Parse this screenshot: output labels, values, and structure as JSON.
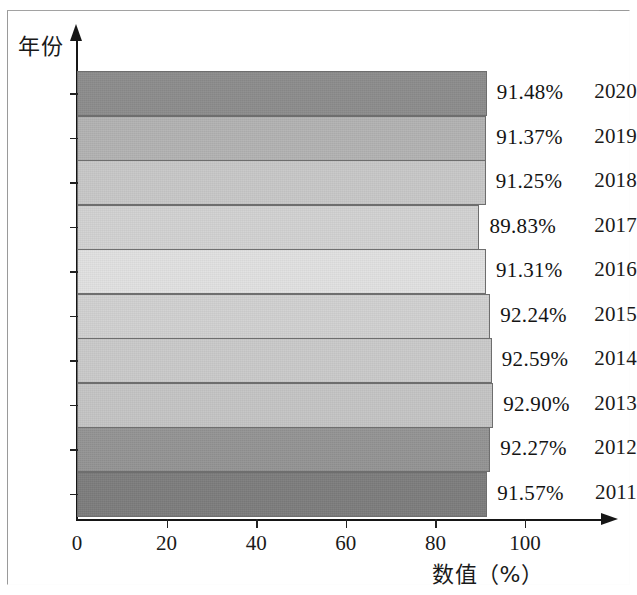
{
  "axes": {
    "y_title": "年份",
    "x_title": "数值（%）",
    "x_ticks": [
      "0",
      "20",
      "40",
      "60",
      "80",
      "100"
    ]
  },
  "chart_data": {
    "type": "bar",
    "orientation": "horizontal",
    "title": "",
    "xlabel": "数值（%）",
    "ylabel": "年份",
    "xlim": [
      0,
      112
    ],
    "grid": false,
    "legend": null,
    "categories": [
      "2020",
      "2019",
      "2018",
      "2017",
      "2016",
      "2015",
      "2014",
      "2013",
      "2012",
      "2011"
    ],
    "values": [
      91.48,
      91.37,
      91.25,
      89.83,
      91.31,
      92.24,
      92.59,
      92.9,
      92.27,
      91.57
    ],
    "value_labels": [
      "91.48%",
      "91.37%",
      "91.25%",
      "89.83%",
      "91.31%",
      "92.24%",
      "92.59%",
      "92.90%",
      "92.27%",
      "91.57%"
    ],
    "bar_colors": [
      "#8d8d8d",
      "#b4b4b4",
      "#c9c9c9",
      "#d3d3d3",
      "#e2e2e2",
      "#d2d2d2",
      "#cbcbcb",
      "#c6c6c6",
      "#959595",
      "#7e7e7e"
    ],
    "bars": [
      {
        "year": "2020",
        "value": 91.48,
        "label": "91.48%",
        "color": "#8d8d8d"
      },
      {
        "year": "2019",
        "value": 91.37,
        "label": "91.37%",
        "color": "#b4b4b4"
      },
      {
        "year": "2018",
        "value": 91.25,
        "label": "91.25%",
        "color": "#c9c9c9"
      },
      {
        "year": "2017",
        "value": 89.83,
        "label": "89.83%",
        "color": "#d3d3d3"
      },
      {
        "year": "2016",
        "value": 91.31,
        "label": "91.31%",
        "color": "#e2e2e2"
      },
      {
        "year": "2015",
        "value": 92.24,
        "label": "92.24%",
        "color": "#d2d2d2"
      },
      {
        "year": "2014",
        "value": 92.59,
        "label": "92.59%",
        "color": "#cbcbcb"
      },
      {
        "year": "2013",
        "value": 92.9,
        "label": "92.90%",
        "color": "#c6c6c6"
      },
      {
        "year": "2012",
        "value": 92.27,
        "label": "92.27%",
        "color": "#959595"
      },
      {
        "year": "2011",
        "value": 91.57,
        "label": "91.57%",
        "color": "#7e7e7e"
      }
    ]
  }
}
